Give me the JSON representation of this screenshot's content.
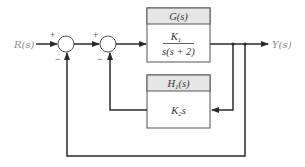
{
  "diagram": {
    "type": "block-diagram",
    "input": {
      "label": "R(s)"
    },
    "output": {
      "label": "Y(s)"
    },
    "summing_junctions": [
      {
        "id": "sum1",
        "signs": {
          "top_left": "+",
          "bottom": "−"
        }
      },
      {
        "id": "sum2",
        "signs": {
          "top_left": "+",
          "bottom": "−"
        }
      }
    ],
    "blocks": [
      {
        "id": "forward",
        "title": "G(s)",
        "numerator": "K",
        "numerator_sub": "1",
        "denominator": "s(s + 2)"
      },
      {
        "id": "feedback",
        "title": "H",
        "title_sub": "1",
        "title_suffix": "(s)",
        "expr": "K",
        "expr_sub": "2",
        "expr_suffix": "s"
      }
    ],
    "colors": {
      "line": "#2a2a2a",
      "header_fill": "#e6e6e6",
      "box_stroke": "#555555",
      "label": "#8a8a8a"
    }
  }
}
